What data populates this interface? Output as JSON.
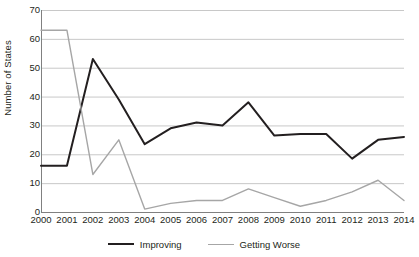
{
  "chart_data": {
    "type": "line",
    "title": "",
    "xlabel": "",
    "ylabel": "Number of States",
    "ylim": [
      0,
      70
    ],
    "ytick_step": 10,
    "yticks": [
      70,
      60,
      50,
      40,
      30,
      20,
      10,
      0
    ],
    "grid": true,
    "grid_axis": "y",
    "legend_position": "bottom",
    "x": [
      2000,
      2001,
      2002,
      2003,
      2004,
      2005,
      2006,
      2007,
      2008,
      2009,
      2010,
      2011,
      2012,
      2013,
      2014
    ],
    "categories": [
      "2000",
      "2001",
      "2002",
      "2003",
      "2004",
      "2005",
      "2006",
      "2007",
      "2008",
      "2009",
      "2010",
      "2011",
      "2012",
      "2013",
      "2014"
    ],
    "series": [
      {
        "name": "Improving",
        "color": "#231f20",
        "values": [
          16,
          16,
          53,
          39,
          23.5,
          29,
          31,
          30,
          38,
          26.5,
          27,
          27,
          18.5,
          25,
          26
        ]
      },
      {
        "name": "Getting Worse",
        "color": "#a6a6a6",
        "values": [
          63,
          63,
          13,
          25,
          1,
          3,
          4,
          4,
          8,
          5,
          2,
          4,
          7,
          11,
          4
        ]
      }
    ]
  },
  "legend": {
    "items": [
      {
        "label": "Improving",
        "swatch": "line-swatch-black"
      },
      {
        "label": "Getting Worse",
        "swatch": "line-swatch-gray"
      }
    ]
  },
  "colors": {
    "improving": "#231f20",
    "getting_worse": "#a6a6a6",
    "gridline": "#c8c8c8",
    "axis": "#808080",
    "background": "#ffffff"
  }
}
